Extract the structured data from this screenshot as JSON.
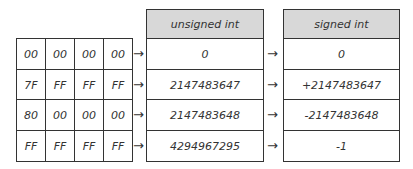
{
  "headers": {
    "unsigned": "unsigned int",
    "signed": "signed int"
  },
  "rows": [
    {
      "bytes": [
        "00",
        "00",
        "00",
        "00"
      ],
      "unsigned": "0",
      "signed": "0"
    },
    {
      "bytes": [
        "7F",
        "FF",
        "FF",
        "FF"
      ],
      "unsigned": "2147483647",
      "signed": "+2147483647"
    },
    {
      "bytes": [
        "80",
        "00",
        "00",
        "00"
      ],
      "unsigned": "2147483648",
      "signed": "-2147483648"
    },
    {
      "bytes": [
        "FF",
        "FF",
        "FF",
        "FF"
      ],
      "unsigned": "4294967295",
      "signed": "-1"
    }
  ],
  "arrow_glyph": "→"
}
